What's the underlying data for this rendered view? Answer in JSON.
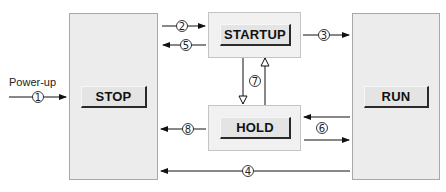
{
  "diagram": {
    "states": [
      {
        "id": "stop",
        "label": "STOP"
      },
      {
        "id": "startup",
        "label": "STARTUP"
      },
      {
        "id": "hold",
        "label": "HOLD"
      },
      {
        "id": "run",
        "label": "RUN"
      }
    ],
    "entry_label": "Power-up",
    "transitions": [
      {
        "num": "1",
        "from": "power-up",
        "to": "STOP"
      },
      {
        "num": "2",
        "from": "STOP",
        "to": "STARTUP"
      },
      {
        "num": "3",
        "from": "STARTUP",
        "to": "RUN"
      },
      {
        "num": "4",
        "from": "RUN",
        "to": "STOP"
      },
      {
        "num": "5",
        "from": "STARTUP",
        "to": "STOP"
      },
      {
        "num": "6",
        "from": "RUN",
        "to": "HOLD / HOLD to RUN"
      },
      {
        "num": "7",
        "from": "STARTUP",
        "to": "HOLD / HOLD to STARTUP"
      },
      {
        "num": "8",
        "from": "HOLD",
        "to": "STOP"
      }
    ],
    "colors": {
      "box_fill": "#ececec",
      "box_border": "#a8a8a8",
      "line": "#111111"
    }
  }
}
